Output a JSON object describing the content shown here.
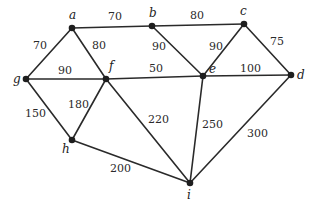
{
  "diagram": {
    "type": "weighted-undirected-graph",
    "nodes": [
      {
        "id": "a",
        "label": "a",
        "x": 72,
        "y": 28,
        "lx": 69,
        "ly": 19
      },
      {
        "id": "b",
        "label": "b",
        "x": 152,
        "y": 26,
        "lx": 149,
        "ly": 17
      },
      {
        "id": "c",
        "label": "c",
        "x": 244,
        "y": 24,
        "lx": 240,
        "ly": 15
      },
      {
        "id": "d",
        "label": "d",
        "x": 291,
        "y": 75,
        "lx": 297,
        "ly": 79
      },
      {
        "id": "e",
        "label": "e",
        "x": 203,
        "y": 76,
        "lx": 209,
        "ly": 73
      },
      {
        "id": "f",
        "label": "f",
        "x": 106,
        "y": 79,
        "lx": 109,
        "ly": 70
      },
      {
        "id": "g",
        "label": "g",
        "x": 26,
        "y": 79,
        "lx": 13,
        "ly": 83
      },
      {
        "id": "h",
        "label": "h",
        "x": 72,
        "y": 140,
        "lx": 62,
        "ly": 153
      },
      {
        "id": "i",
        "label": "i",
        "x": 190,
        "y": 183,
        "lx": 187,
        "ly": 199
      }
    ],
    "edges": [
      {
        "from": "a",
        "to": "b",
        "weight": "70",
        "wx": 108,
        "wy": 20
      },
      {
        "from": "b",
        "to": "c",
        "weight": "80",
        "wx": 190,
        "wy": 19
      },
      {
        "from": "a",
        "to": "g",
        "weight": "70",
        "wx": 33,
        "wy": 49
      },
      {
        "from": "a",
        "to": "f",
        "weight": "80",
        "wx": 92,
        "wy": 49
      },
      {
        "from": "b",
        "to": "e",
        "weight": "90",
        "wx": 152,
        "wy": 50
      },
      {
        "from": "c",
        "to": "e",
        "weight": "90",
        "wx": 209,
        "wy": 50
      },
      {
        "from": "c",
        "to": "d",
        "weight": "75",
        "wx": 270,
        "wy": 45
      },
      {
        "from": "g",
        "to": "f",
        "weight": "90",
        "wx": 58,
        "wy": 74
      },
      {
        "from": "f",
        "to": "e",
        "weight": "50",
        "wx": 149,
        "wy": 72
      },
      {
        "from": "e",
        "to": "d",
        "weight": "100",
        "wx": 240,
        "wy": 72
      },
      {
        "from": "g",
        "to": "h",
        "weight": "150",
        "wx": 25,
        "wy": 117
      },
      {
        "from": "f",
        "to": "h",
        "weight": "180",
        "wx": 68,
        "wy": 108
      },
      {
        "from": "f",
        "to": "i",
        "weight": "220",
        "wx": 148,
        "wy": 123
      },
      {
        "from": "e",
        "to": "i",
        "weight": "250",
        "wx": 202,
        "wy": 128
      },
      {
        "from": "d",
        "to": "i",
        "weight": "300",
        "wx": 247,
        "wy": 137
      },
      {
        "from": "h",
        "to": "i",
        "weight": "200",
        "wx": 110,
        "wy": 172
      }
    ]
  }
}
